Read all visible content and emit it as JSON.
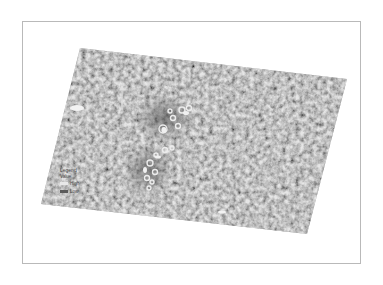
{
  "map": {
    "type": "grayscale satellite raster (SAR)",
    "frame": {
      "x": 22,
      "y": 21,
      "width": 339,
      "height": 243,
      "border_color": "#b9b9b9"
    },
    "raster_corners": {
      "top_left": [
        80,
        48
      ],
      "top_right": [
        347,
        79
      ],
      "bottom_right": [
        307,
        234
      ],
      "bottom_left": [
        41,
        204
      ]
    },
    "colors": {
      "background": "#ffffff",
      "raster_base": "#9c9c9c",
      "raster_light": "#c4c4c4",
      "raster_dark": "#6e6e6e",
      "feature_dark": "#4a4a4a",
      "feature_bright": "#f0f0f0"
    },
    "features": [
      {
        "name": "dark-feature-cluster-north",
        "center": [
          165,
          120
        ]
      },
      {
        "name": "dark-feature-cluster-south",
        "center": [
          148,
          170
        ]
      },
      {
        "name": "bright-patch-west",
        "center": [
          77,
          108
        ]
      },
      {
        "name": "bright-patch-south",
        "center": [
          222,
          212
        ]
      }
    ],
    "north_arrow": {
      "x": 122,
      "y1": 86,
      "y2": 110
    }
  },
  "legend": {
    "title": "Legend",
    "subtitle": "Value",
    "items": [
      {
        "label": "High",
        "swatch": "#e8e8e8"
      },
      {
        "label": "Low",
        "swatch": "#5a5a5a"
      }
    ]
  }
}
